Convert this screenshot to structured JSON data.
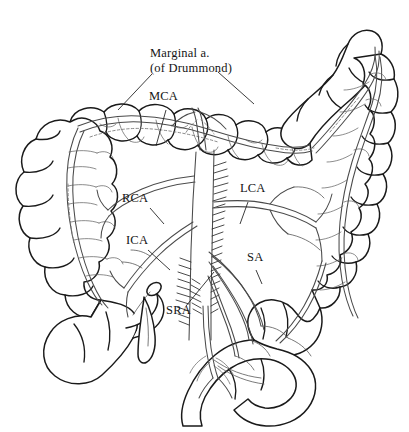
{
  "figure": {
    "background_color": "#ffffff",
    "ink_color": "#1a1a1a",
    "vessel_color": "#4a4a4a",
    "style": "pen-and-ink line drawing"
  },
  "labels": {
    "marginal_line1": "Marginal a.",
    "marginal_line2": "(of Drummond)",
    "mca": "MCA",
    "rca": "RCA",
    "ica": "ICA",
    "lca": "LCA",
    "sa": "SA",
    "sra": "SRA"
  },
  "label_positions": {
    "marginal": {
      "x": 150,
      "y": 52
    },
    "mca": {
      "x": 149,
      "y": 96
    },
    "rca": {
      "x": 122,
      "y": 198
    },
    "ica": {
      "x": 126,
      "y": 240
    },
    "lca": {
      "x": 240,
      "y": 188
    },
    "sa": {
      "x": 247,
      "y": 256
    },
    "sra": {
      "x": 166,
      "y": 310
    }
  },
  "structures": [
    {
      "name": "cecum",
      "side": "right"
    },
    {
      "name": "ascending-colon",
      "side": "right"
    },
    {
      "name": "hepatic-flexure",
      "side": "right"
    },
    {
      "name": "transverse-colon",
      "side": "middle"
    },
    {
      "name": "splenic-flexure",
      "side": "left"
    },
    {
      "name": "descending-colon",
      "side": "left"
    },
    {
      "name": "sigmoid-colon",
      "side": "left"
    },
    {
      "name": "rectum",
      "side": "middle"
    },
    {
      "name": "ileum",
      "side": "right"
    },
    {
      "name": "appendix",
      "side": "right"
    },
    {
      "name": "aorta",
      "side": "middle"
    }
  ],
  "vessels": [
    {
      "abbr": "MCA",
      "name": "Middle colic artery"
    },
    {
      "abbr": "RCA",
      "name": "Right colic artery"
    },
    {
      "abbr": "ICA",
      "name": "Ileocolic artery"
    },
    {
      "abbr": "LCA",
      "name": "Left colic artery"
    },
    {
      "abbr": "SA",
      "name": "Sigmoid arteries"
    },
    {
      "abbr": "SRA",
      "name": "Superior rectal artery"
    },
    {
      "abbr": "Marginal a.",
      "name": "Marginal artery of Drummond"
    }
  ]
}
